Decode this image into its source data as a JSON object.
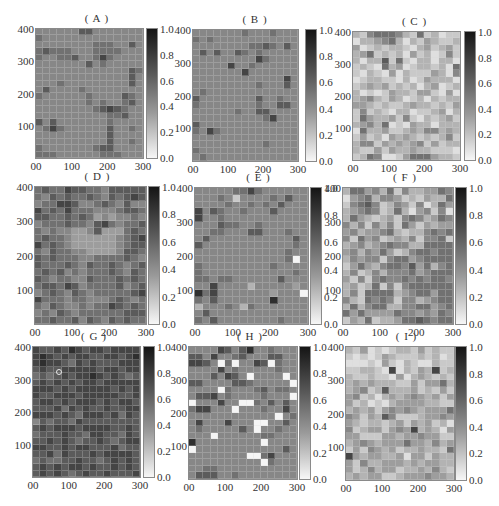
{
  "chart_data": [
    {
      "panel": "A",
      "title": "( A )",
      "type": "heatmap",
      "xlim": [
        0,
        300
      ],
      "ylim": [
        0,
        400
      ],
      "cell_size": 20,
      "grid_cols": 15,
      "grid_rows": 20,
      "x_ticks": [
        "00",
        "100",
        "200",
        "300"
      ],
      "y_ticks": [
        "400",
        "300",
        "200",
        "100"
      ],
      "colorbar": {
        "min": 0.0,
        "max": 1.0,
        "ticks": [
          "1.0",
          "0.8",
          "0.6",
          "0.4",
          "0.2",
          "0.0"
        ],
        "colormap": "gray_r"
      },
      "value_encoding": "each digit d = cell value d/10, rows listed from y=400 (top) to y=0",
      "rows": [
        "555555775555555",
        "655555555555555",
        "555555556665575",
        "676665556666555",
        "655667556865555",
        "555555575655555",
        "555555555555576",
        "555555555555575",
        "555655555555575",
        "575555655555555",
        "655555565555765",
        "555555565655675",
        "555555556787655",
        "555555555566755",
        "757555555565555",
        "568655555575565",
        "555555555575555",
        "555555555575565",
        "655555556775555",
        "666555555666555"
      ]
    },
    {
      "panel": "B",
      "title": "( B )",
      "type": "heatmap",
      "xlim": [
        0,
        300
      ],
      "ylim": [
        0,
        400
      ],
      "cell_size": 20,
      "grid_cols": 15,
      "grid_rows": 20,
      "x_ticks": [
        "00",
        "100",
        "200",
        "300"
      ],
      "y_ticks": [
        "400",
        "300",
        "200",
        "100"
      ],
      "colorbar": {
        "min": 0.0,
        "max": 1.0,
        "ticks": [
          "1.0",
          "0.8",
          "0.6",
          "0.4",
          "0.2",
          "0.0"
        ],
        "colormap": "gray_r"
      },
      "value_encoding": "each digit d = cell value d/10, rows listed from y=400 (top) to y=0",
      "rows": [
        "555555565556555",
        "656555555555555",
        "555555556676575",
        "575755765655555",
        "555555555865555",
        "555558556555555",
        "555555585555555",
        "555555555555585",
        "555555555655575",
        "565555555555555",
        "755555555755655",
        "655555555655775",
        "555555655775555",
        "555555555568555",
        "755555555555555",
        "658655555555555",
        "555555555555555",
        "555555555565555",
        "655555555555555",
        "565555555555555"
      ]
    },
    {
      "panel": "C",
      "title": "( C )",
      "type": "heatmap",
      "xlim": [
        0,
        300
      ],
      "ylim": [
        0,
        400
      ],
      "cell_size": 20,
      "grid_cols": 15,
      "grid_rows": 20,
      "x_ticks": [
        "00",
        "100",
        "200",
        "300"
      ],
      "y_ticks": [
        "400",
        "300",
        "200",
        "100"
      ],
      "colorbar": {
        "min": 0.0,
        "max": 1.0,
        "ticks": [
          "1.0",
          "0.8",
          "0.6",
          "0.4",
          "0.2",
          "0.0"
        ],
        "colormap": "gray_r"
      },
      "value_encoding": "each digit d = cell value d/10, rows listed from y=400 (top) to y=0",
      "rows": [
        "325666532623122",
        "133456313243223",
        "412323321342342",
        "346232314231252",
        "313372621331331",
        "232163412332316",
        "213214132224315",
        "123322131243331",
        "234342323134123",
        "312124332442141",
        "345324312313233",
        "443232234332324",
        "252321331223413",
        "264334252132342",
        "345361214331333",
        "163342234355343",
        "242314343232352",
        "355243434524233",
        "322424334332221",
        "236511246664332"
      ]
    },
    {
      "panel": "D",
      "title": "( D )",
      "type": "heatmap",
      "xlim": [
        0,
        300
      ],
      "ylim": [
        0,
        400
      ],
      "cell_size": 20,
      "grid_cols": 15,
      "grid_rows": 20,
      "x_ticks": [
        "00",
        "100",
        "200",
        "300"
      ],
      "y_ticks": [
        "400",
        "300",
        "200",
        "100"
      ],
      "colorbar": {
        "min": 0.0,
        "max": 1.0,
        "ticks": [
          "1.0",
          "0.8",
          "0.6",
          "0.4",
          "0.2",
          "0.0"
        ],
        "colormap": "gray_r"
      },
      "value_encoding": "each digit d = cell value d/10, rows listed from y=400 (top) to y=0",
      "rows": [
        "676687766577777",
        "657676676576787",
        "566887556765755",
        "867686665556776",
        "776676764545565",
        "566676657865667",
        "656554457444676",
        "676654444445678",
        "867654444445677",
        "657665544445776",
        "767666556666765",
        "766676576676567",
        "676756566676576",
        "765665576667676",
        "677687566667567",
        "567657656666678",
        "866656655567656",
        "657655656687676",
        "565765666666777",
        "667667576576766"
      ]
    },
    {
      "panel": "E",
      "title": "( E )",
      "type": "heatmap",
      "xlim": [
        0,
        300
      ],
      "ylim": [
        0,
        400
      ],
      "cell_size": 20,
      "grid_cols": 15,
      "grid_rows": 20,
      "x_ticks": [
        "00",
        "100",
        "200",
        "300"
      ],
      "y_ticks": [
        "400",
        "300",
        "200",
        "100"
      ],
      "colorbar": {
        "min": 0.0,
        "max": 1.0,
        "ticks": [
          "1.0",
          "0.8",
          "0.6",
          "0.4",
          "0.2",
          "0.0"
        ],
        "colormap": "gray_r"
      },
      "value_encoding": "each digit d = cell value d/10, rows listed from y=400 (top) to y=0",
      "rows": [
        "555556686555555",
        "555652555565755",
        "555565565657555",
        "857655655575555",
        "855655555555555",
        "555766556555555",
        "556655577555655",
        "575555555555575",
        "755555555555565",
        "555555555555655",
        "555555555555605",
        "655555555565555",
        "655555555555565",
        "665665555557555",
        "558555535555545",
        "968555555545550",
        "657555555595555",
        "355565365555555",
        "575555555555555",
        "657555555556555"
      ]
    },
    {
      "panel": "F",
      "title": "( F )",
      "type": "heatmap",
      "xlim": [
        0,
        300
      ],
      "ylim": [
        0,
        400
      ],
      "cell_size": 20,
      "grid_cols": 15,
      "grid_rows": 20,
      "x_ticks": [
        "00",
        "100",
        "200",
        "300"
      ],
      "y_ticks": [
        "400",
        "300",
        "200",
        "100"
      ],
      "colorbar": {
        "min": 0.0,
        "max": 1.0,
        "ticks": [
          "1.0",
          "0.8",
          "0.6",
          "0.4",
          "0.2",
          "0.0"
        ],
        "colormap": "gray_r"
      },
      "value_encoding": "each digit d = cell value d/10, rows listed from y=400 (top) to y=0",
      "rows": [
        "366453625334465",
        "145635542324336",
        "256752354251364",
        "345652363145251",
        "364323425653465",
        "535253526424344",
        "453445632335656",
        "526452343525562",
        "345345655336666",
        "453546423566566",
        "354552566456666",
        "246435665746356",
        "352353555645666",
        "425256556565665",
        "342362525666666",
        "352666634566466",
        "532656525534566",
        "363566335566456",
        "646444465545465",
        "243623346676566"
      ]
    },
    {
      "panel": "G",
      "title": "( G )",
      "type": "heatmap",
      "xlim": [
        0,
        300
      ],
      "ylim": [
        0,
        400
      ],
      "cell_size": 20,
      "grid_cols": 15,
      "grid_rows": 20,
      "x_ticks": [
        "00",
        "100",
        "200",
        "300"
      ],
      "y_ticks": [
        "400",
        "300",
        "200",
        "100"
      ],
      "colorbar": {
        "min": 0.0,
        "max": 1.0,
        "ticks": [
          "1.0",
          "0.8",
          "0.6",
          "0.4",
          "0.2",
          "0.0"
        ],
        "colormap": "gray_r"
      },
      "value_encoding": "each digit d = cell value d/10, rows listed from y=400 (top) to y=0",
      "annotations": [
        {
          "type": "circle-marker",
          "x": 75,
          "y": 325
        }
      ],
      "rows": [
        "877879878878888",
        "898787887788789",
        "898876878777888",
        "787788888788788",
        "676787889878767",
        "787878788788888",
        "888787888887878",
        "877888788888778",
        "788787888787887",
        "777868787787788",
        "888787688878687",
        "576776877777777",
        "787888788887787",
        "677787768877687",
        "778787677876788",
        "887787887778677",
        "778687778788887",
        "676677877678787",
        "787878878778787",
        "787876787787778"
      ]
    },
    {
      "panel": "H",
      "title": "( H )",
      "type": "heatmap",
      "xlim": [
        0,
        300
      ],
      "ylim": [
        0,
        400
      ],
      "cell_size": 20,
      "grid_cols": 15,
      "grid_rows": 20,
      "x_ticks": [
        "00",
        "100",
        "200",
        "300"
      ],
      "y_ticks": [
        "400",
        "300",
        "200",
        "100"
      ],
      "colorbar": {
        "min": 0.0,
        "max": 1.0,
        "ticks": [
          "1.0",
          "0.8",
          "0.6",
          "0.4",
          "0.2",
          "0.0"
        ],
        "colormap": "gray_r"
      },
      "value_encoding": "each digit d = cell value d/10, rows listed from y=400 (top) to y=0",
      "rows": [
        "555587579556555",
        "775855675557755",
        "887506055870655",
        "555585655555655",
        "555758750555505",
        "775555776555550",
        "555506555675665",
        "577856555565550",
        "055585500657575",
        "688555055565585",
        "555555555555056",
        "585558555005575",
        "565555575055655",
        "555055555566555",
        "955555555505555",
        "055555555555575",
        "555555550068555",
        "555555555506555",
        "556655555555555",
        "577755655555555"
      ]
    },
    {
      "panel": "I",
      "title": "( I )",
      "type": "heatmap",
      "xlim": [
        0,
        300
      ],
      "ylim": [
        0,
        400
      ],
      "cell_size": 20,
      "grid_cols": 15,
      "grid_rows": 20,
      "x_ticks": [
        "00",
        "100",
        "200",
        "300"
      ],
      "y_ticks": [
        "400",
        "300",
        "200",
        "100"
      ],
      "colorbar": {
        "min": 0.0,
        "max": 1.0,
        "ticks": [
          "1.0",
          "0.8",
          "0.6",
          "0.4",
          "0.2",
          "0.0"
        ],
        "colormap": "gray_r"
      },
      "value_encoding": "each digit d = cell value d/10, rows listed from y=400 (top) to y=0",
      "rows": [
        "324121233242322",
        "212124322232312",
        "111214213211322",
        "223321813243823",
        "322322141343232",
        "343433322424463",
        "345237333423242",
        "452313434543424",
        "423121344443322",
        "343424545434446",
        "542437522234454",
        "432332342434231",
        "523442454834314",
        "442224434454422",
        "345434446443534",
        "242543423343326",
        "843443341442433",
        "425334443434433",
        "423534423343532",
        "343442234445443"
      ]
    }
  ]
}
